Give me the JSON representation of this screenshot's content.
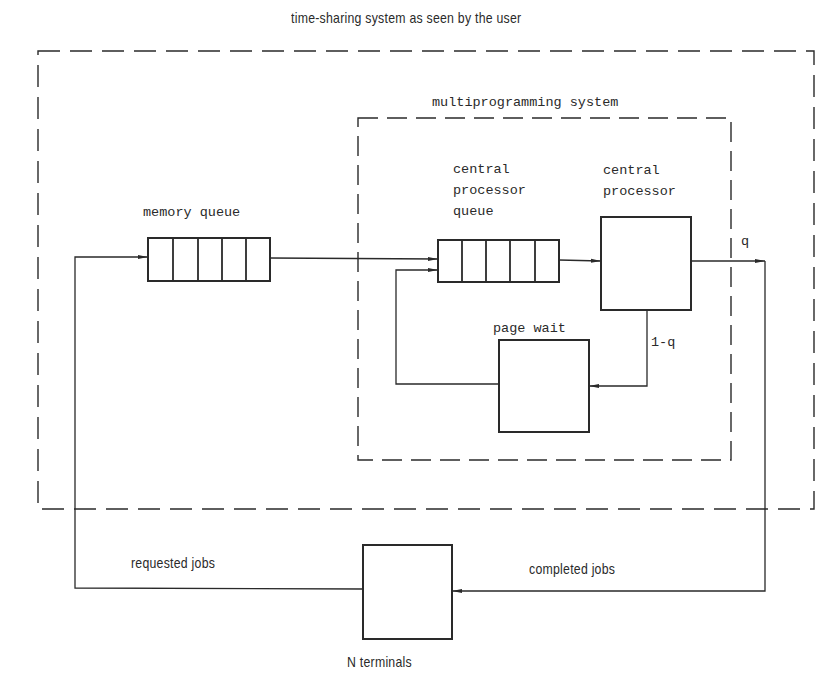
{
  "title": "time-sharing system as seen by the user",
  "boundaries": {
    "outer": {
      "label": "time-sharing system as seen by the user",
      "style": "dashed"
    },
    "inner": {
      "label": "multiprogramming system",
      "style": "dashed"
    }
  },
  "nodes": {
    "memory_queue": {
      "label": "memory queue",
      "type": "queue",
      "slots": 5
    },
    "cpu_queue": {
      "label_lines": [
        "central",
        "processor",
        "queue"
      ],
      "type": "queue",
      "slots": 5
    },
    "cpu": {
      "label_lines": [
        "central",
        "processor"
      ],
      "type": "server"
    },
    "page_wait": {
      "label": "page wait",
      "type": "server"
    },
    "terminals": {
      "label": "N terminals",
      "type": "server"
    }
  },
  "edges": {
    "cpu_exit": {
      "label": "q",
      "from": "central processor",
      "to": "N terminals"
    },
    "cpu_page_fault": {
      "label": "1-q",
      "from": "central processor",
      "to": "page wait"
    },
    "page_wait_return": {
      "label": "",
      "from": "page wait",
      "to": "central processor queue"
    },
    "memory_to_cpu_queue": {
      "label": "",
      "from": "memory queue",
      "to": "central processor queue"
    },
    "requested": {
      "label": "requested jobs",
      "from": "N terminals",
      "to": "memory queue"
    },
    "completed": {
      "label": "completed jobs",
      "from": "central processor",
      "to": "N terminals"
    }
  },
  "colors": {
    "ink": "#2a2a2a",
    "background": "#ffffff"
  }
}
